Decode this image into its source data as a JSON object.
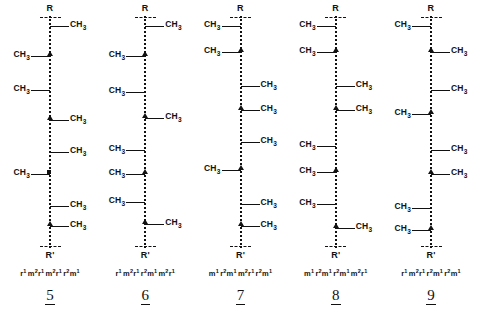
{
  "figure": {
    "terminus_top": "R",
    "terminus_bottom": "R'",
    "methyl_label": "CH",
    "methyl_sub": "3",
    "structures": [
      {
        "numeral": "5",
        "notation": "r¹ m²r¹ m²r¹ r²m¹",
        "notation_groups": [
          "r1",
          "m2r1",
          "m2r1",
          "r2m1"
        ],
        "nodes": [
          {
            "side": "right",
            "y": 26,
            "marker": "none"
          },
          {
            "side": "left",
            "y": 56,
            "marker": "tri"
          },
          {
            "side": "left",
            "y": 90,
            "marker": "none"
          },
          {
            "side": "right",
            "y": 120,
            "marker": "tri"
          },
          {
            "side": "right",
            "y": 152,
            "marker": "none"
          },
          {
            "side": "left",
            "y": 174,
            "marker": "sq"
          },
          {
            "side": "right",
            "y": 206,
            "marker": "none"
          },
          {
            "side": "right",
            "y": 226,
            "marker": "tri"
          }
        ]
      },
      {
        "numeral": "6",
        "notation": "r¹ m²r¹ r²m¹ m²r¹",
        "notation_groups": [
          "r1",
          "m2r1",
          "r2m1",
          "m2r1"
        ],
        "nodes": [
          {
            "side": "right",
            "y": 26,
            "marker": "none"
          },
          {
            "side": "left",
            "y": 56,
            "marker": "tri"
          },
          {
            "side": "left",
            "y": 92,
            "marker": "none"
          },
          {
            "side": "right",
            "y": 118,
            "marker": "tri"
          },
          {
            "side": "left",
            "y": 150,
            "marker": "none"
          },
          {
            "side": "left",
            "y": 174,
            "marker": "tri"
          },
          {
            "side": "left",
            "y": 202,
            "marker": "none"
          },
          {
            "side": "right",
            "y": 224,
            "marker": "tri"
          }
        ]
      },
      {
        "numeral": "7",
        "notation": "m¹ r²m¹ m²r¹ r²m¹",
        "notation_groups": [
          "m1",
          "r2m1",
          "m2r1",
          "r2m1"
        ],
        "nodes": [
          {
            "side": "left",
            "y": 26,
            "marker": "none"
          },
          {
            "side": "left",
            "y": 52,
            "marker": "tri"
          },
          {
            "side": "right",
            "y": 86,
            "marker": "none"
          },
          {
            "side": "right",
            "y": 110,
            "marker": "tri"
          },
          {
            "side": "right",
            "y": 142,
            "marker": "none"
          },
          {
            "side": "left",
            "y": 170,
            "marker": "tri"
          },
          {
            "side": "right",
            "y": 204,
            "marker": "none"
          },
          {
            "side": "right",
            "y": 226,
            "marker": "tri"
          }
        ]
      },
      {
        "numeral": "8",
        "notation": "m¹ r²m¹ r²m¹ m²r¹",
        "notation_groups": [
          "m1",
          "r2m1",
          "r2m1",
          "m2r1"
        ],
        "nodes": [
          {
            "side": "left",
            "y": 26,
            "marker": "none"
          },
          {
            "side": "left",
            "y": 52,
            "marker": "tri"
          },
          {
            "side": "right",
            "y": 86,
            "marker": "none"
          },
          {
            "side": "right",
            "y": 110,
            "marker": "tri"
          },
          {
            "side": "left",
            "y": 146,
            "marker": "none"
          },
          {
            "side": "left",
            "y": 172,
            "marker": "tri"
          },
          {
            "side": "left",
            "y": 204,
            "marker": "none"
          },
          {
            "side": "right",
            "y": 228,
            "marker": "tri"
          }
        ]
      },
      {
        "numeral": "9",
        "notation": "r¹ m²r¹ r²m¹ r²m¹",
        "notation_groups": [
          "r1",
          "m2r1",
          "r2m1",
          "r2m1"
        ],
        "nodes": [
          {
            "side": "left",
            "y": 26,
            "marker": "none"
          },
          {
            "side": "right",
            "y": 52,
            "marker": "tri"
          },
          {
            "side": "right",
            "y": 90,
            "marker": "none"
          },
          {
            "side": "left",
            "y": 114,
            "marker": "tri"
          },
          {
            "side": "right",
            "y": 150,
            "marker": "none"
          },
          {
            "side": "right",
            "y": 174,
            "marker": "tri"
          },
          {
            "side": "left",
            "y": 208,
            "marker": "none"
          },
          {
            "side": "left",
            "y": 230,
            "marker": "tri"
          }
        ]
      }
    ]
  }
}
